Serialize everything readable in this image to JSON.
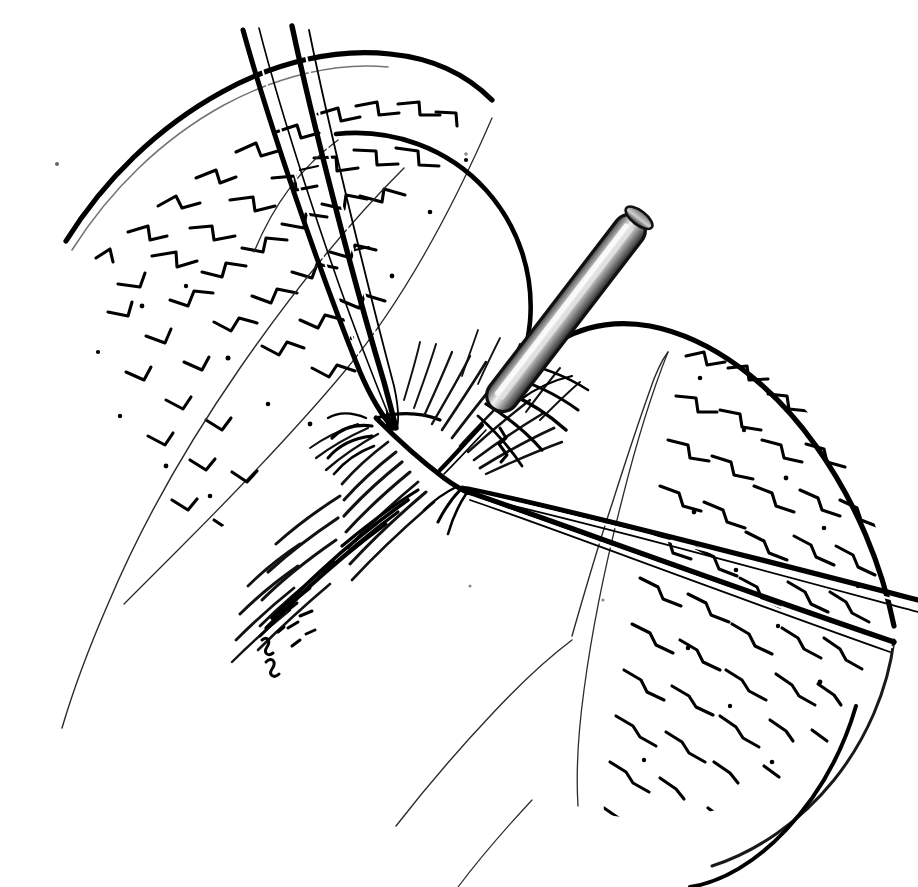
{
  "figure": {
    "domain_kind": "medical-surgical-line-illustration",
    "title": "",
    "caption": "",
    "background_color": "#ffffff",
    "ink_color": "#000000",
    "canvas": {
      "width": 918,
      "height": 887
    }
  },
  "palette": {
    "ink": "#000000",
    "thin_ink": "#2b2b2b",
    "hair_ink": "#111111",
    "probe_dark": "#1e1e1e",
    "probe_mid": "#8d8d8d",
    "probe_highlight": "#f2f2f2",
    "probe_shadow": "#4a4a4a",
    "paper": "#ffffff"
  },
  "objects": [
    {
      "id": "tissue-flap-left",
      "name": "left-tissue-flap",
      "label": "Left retracted tissue flap (stippled cortex)",
      "texture": "dashed-reticular-stipple",
      "position": "upper-left"
    },
    {
      "id": "tissue-flap-right",
      "name": "right-tissue-flap",
      "label": "Right retracted tissue flap (stippled cortex)",
      "texture": "dashed-reticular-stipple",
      "position": "right"
    },
    {
      "id": "organ-body",
      "name": "underlying-organ-contour",
      "label": "Underlying organ body contour",
      "texture": "thin-outline",
      "position": "center"
    },
    {
      "id": "incision-edge",
      "name": "incision-fiber-edge",
      "label": "Incised fibrous edge with fringe of cut fibers",
      "texture": "hair-fringe",
      "position": "center-diagonal"
    },
    {
      "id": "forceps-upper-left",
      "name": "forceps-upper-left",
      "label": "Fine forceps entering from upper left, tips closed on tissue edge",
      "tip_point": {
        "x": 393,
        "y": 428
      },
      "blades": 2
    },
    {
      "id": "forceps-lower-right",
      "name": "forceps-lower-right",
      "label": "Fine forceps entering from lower right, tips closed on tissue edge",
      "tip_point": {
        "x": 466,
        "y": 489
      },
      "blades": 2
    },
    {
      "id": "probe-instrument",
      "name": "metallic-probe",
      "label": "Metallic probe / needle holder shaft with cylindrical highlight",
      "tip_point": {
        "x": 470,
        "y": 440
      },
      "butt_point": {
        "x": 660,
        "y": 186
      },
      "shading": "linear-metallic-gradient"
    }
  ],
  "annotations": {
    "visible_text": [],
    "leader_lines": [],
    "numbers": []
  },
  "accessibility": {
    "alt": "Black and white surgical line drawing: two pairs of fine forceps grasp the opposing cut edges of tissue while a shaded metallic probe is introduced between them; stippled tissue flaps are retracted to either side.",
    "view_label": "surgical-field-illustration"
  }
}
